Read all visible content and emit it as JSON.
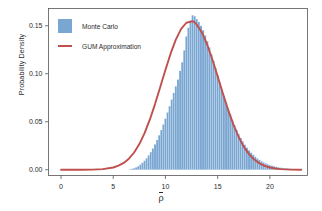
{
  "chart_data": {
    "type": "bar",
    "title": "",
    "subtitle": "",
    "xlabel": "ρ̄",
    "ylabel": "Probability Density",
    "xlim": [
      -1.2,
      23.6
    ],
    "ylim": [
      -0.006,
      0.168
    ],
    "xticks": [
      0,
      5,
      10,
      15,
      20
    ],
    "xticklabels": [
      "0",
      "5",
      "10",
      "15",
      "20"
    ],
    "yticks": [
      0.0,
      0.05,
      0.1,
      0.15
    ],
    "yticklabels": [
      "0.00",
      "0.05",
      "0.10",
      "0.15"
    ],
    "grid": false,
    "legend_position": "upper-left",
    "series": [
      {
        "name": "Monte Carlo",
        "type": "histogram",
        "color": "#7aa6d2",
        "bin_width": 0.2,
        "bin_centers": [
          6.6,
          6.8,
          7.0,
          7.2,
          7.4,
          7.6,
          7.8,
          8.0,
          8.2,
          8.4,
          8.6,
          8.8,
          9.0,
          9.2,
          9.4,
          9.6,
          9.8,
          10.0,
          10.2,
          10.4,
          10.6,
          10.8,
          11.0,
          11.2,
          11.4,
          11.6,
          11.8,
          12.0,
          12.2,
          12.4,
          12.6,
          12.8,
          13.0,
          13.2,
          13.4,
          13.6,
          13.8,
          14.0,
          14.2,
          14.4,
          14.6,
          14.8,
          15.0,
          15.2,
          15.4,
          15.6,
          15.8,
          16.0,
          16.2,
          16.4,
          16.6,
          16.8,
          17.0,
          17.2,
          17.4,
          17.6,
          17.8,
          18.0,
          18.2,
          18.4,
          18.6,
          18.8,
          19.0,
          19.2,
          19.4,
          19.6,
          19.8,
          20.0,
          20.2,
          20.4,
          20.6,
          20.8,
          21.0,
          21.2,
          21.4,
          21.6,
          21.8,
          22.0,
          22.2,
          22.4,
          22.6,
          22.8
        ],
        "values": [
          0.0005,
          0.001,
          0.0017,
          0.0026,
          0.0038,
          0.0053,
          0.0072,
          0.0094,
          0.012,
          0.015,
          0.0184,
          0.0222,
          0.0264,
          0.031,
          0.036,
          0.0414,
          0.0472,
          0.0533,
          0.0597,
          0.0663,
          0.0731,
          0.08,
          0.087,
          0.094,
          0.103,
          0.112,
          0.1245,
          0.139,
          0.148,
          0.1555,
          0.161,
          0.16,
          0.157,
          0.154,
          0.15,
          0.1455,
          0.14,
          0.134,
          0.1275,
          0.1205,
          0.1135,
          0.106,
          0.0985,
          0.0912,
          0.084,
          0.077,
          0.0702,
          0.0638,
          0.0577,
          0.052,
          0.0467,
          0.0418,
          0.0373,
          0.0332,
          0.0295,
          0.0261,
          0.023,
          0.0203,
          0.0178,
          0.0156,
          0.0136,
          0.0118,
          0.0103,
          0.0089,
          0.0077,
          0.0067,
          0.0057,
          0.0049,
          0.0042,
          0.0036,
          0.0031,
          0.0026,
          0.0022,
          0.0019,
          0.0016,
          0.0014,
          0.0011,
          0.001,
          0.0008,
          0.0007,
          0.0006,
          0.0005
        ]
      },
      {
        "name": "GUM Approximation",
        "type": "line",
        "color": "#c0504d",
        "distribution": "normal",
        "mean": 12.7,
        "sigma": 2.58,
        "peak_value": 0.1546,
        "x": [
          0.0,
          1.0,
          2.0,
          3.0,
          4.0,
          5.0,
          5.5,
          6.0,
          6.5,
          7.0,
          7.5,
          8.0,
          8.5,
          9.0,
          9.5,
          10.0,
          10.5,
          11.0,
          11.5,
          12.0,
          12.5,
          12.7,
          13.0,
          13.5,
          14.0,
          14.5,
          15.0,
          15.5,
          16.0,
          16.5,
          17.0,
          17.5,
          18.0,
          18.5,
          19.0,
          19.5,
          20.0,
          20.5,
          21.0,
          22.0,
          23.0
        ],
        "y": [
          0.0,
          0.0,
          1e-05,
          6e-05,
          0.00029,
          0.0011,
          0.00196,
          0.00332,
          0.00539,
          0.00837,
          0.01246,
          0.01777,
          0.0243,
          0.03188,
          0.04014,
          0.04855,
          0.05648,
          0.06328,
          0.06838,
          0.07137,
          0.07205,
          0.072,
          0.07044,
          0.06656,
          0.06069,
          0.0534,
          0.04531,
          0.03702,
          0.0291,
          0.022,
          0.01602,
          0.01124,
          0.00759,
          0.00493,
          0.00309,
          0.00186,
          0.00108,
          0.0006,
          0.00032,
          8e-05,
          2e-05
        ]
      }
    ]
  },
  "legend": {
    "items": [
      {
        "label": "Monte Carlo",
        "marker": "swatch",
        "color": "#7aa6d2"
      },
      {
        "label": "GUM Approximation",
        "marker": "line",
        "color": "#c0504d"
      }
    ]
  },
  "axes": {
    "x_label": "ρ̄",
    "y_label": "Probability Density"
  }
}
